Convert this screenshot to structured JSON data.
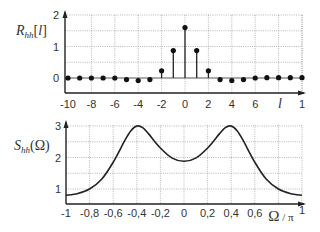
{
  "chart_data": [
    {
      "type": "stem",
      "ylabel": "R_hh[l]",
      "ylabel_main": "R",
      "ylabel_sub": "hh",
      "ylabel_arg": "[l]",
      "xlabel": "l",
      "x_ticks": [
        "-10",
        "-8",
        "-6",
        "-4",
        "-2",
        "0",
        "2",
        "4",
        "6",
        "1"
      ],
      "x_tick_values": [
        -10,
        -8,
        -6,
        -4,
        -2,
        0,
        2,
        4,
        6,
        10
      ],
      "y_ticks": [
        "0",
        "1",
        "2"
      ],
      "y_tick_values": [
        0,
        1,
        2
      ],
      "xlim": [
        -10,
        10
      ],
      "ylim": [
        -0.5,
        2
      ],
      "grid": true,
      "x": [
        -10,
        -9,
        -8,
        -7,
        -6,
        -5,
        -4,
        -3,
        -2,
        -1,
        0,
        1,
        2,
        3,
        4,
        5,
        6,
        7,
        8,
        9,
        10
      ],
      "values": [
        0.0,
        0.0,
        0.0,
        0.0,
        0.0,
        -0.05,
        -0.08,
        -0.05,
        0.23,
        0.87,
        1.6,
        0.87,
        0.23,
        -0.05,
        -0.08,
        -0.05,
        0.0,
        0.01,
        0.01,
        0.01,
        0.01
      ]
    },
    {
      "type": "line",
      "ylabel": "S_hh(Ω)",
      "ylabel_main": "S",
      "ylabel_sub": "hh",
      "ylabel_arg": "(Ω)",
      "xlabel": "Ω / π",
      "x_ticks": [
        "-1",
        "-0,8",
        "-0,6",
        "-0,4",
        "-0,2",
        "0",
        "0,2",
        "0,4",
        "0,6",
        "1"
      ],
      "x_tick_values": [
        -1,
        -0.8,
        -0.6,
        -0.4,
        -0.2,
        0,
        0.2,
        0.4,
        0.6,
        1
      ],
      "y_ticks": [
        "1",
        "2",
        "3"
      ],
      "y_tick_values": [
        1,
        2,
        3
      ],
      "xlim": [
        -1,
        1
      ],
      "ylim": [
        0.5,
        3
      ],
      "grid": true,
      "x": [
        -1,
        -0.9,
        -0.8,
        -0.7,
        -0.6,
        -0.5,
        -0.45,
        -0.4,
        -0.35,
        -0.3,
        -0.2,
        -0.1,
        0,
        0.1,
        0.2,
        0.3,
        0.35,
        0.4,
        0.45,
        0.5,
        0.6,
        0.7,
        0.8,
        0.9,
        1
      ],
      "values": [
        0.8,
        0.86,
        1.0,
        1.3,
        1.85,
        2.55,
        2.85,
        3.0,
        2.95,
        2.75,
        2.3,
        1.98,
        1.88,
        1.98,
        2.3,
        2.75,
        2.95,
        3.0,
        2.85,
        2.55,
        1.85,
        1.3,
        1.0,
        0.86,
        0.8
      ]
    }
  ]
}
